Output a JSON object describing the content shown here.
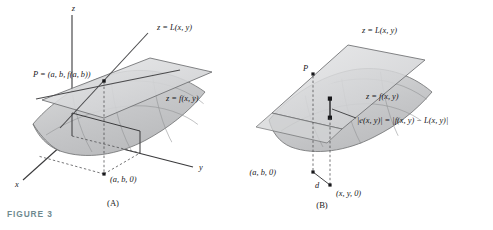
{
  "figure": {
    "caption": "FIGURE 3",
    "caption_color": "#6f8a90",
    "width": 493,
    "height": 230
  },
  "panels": [
    {
      "id": "A",
      "panel_label": "(A)",
      "axes": [
        {
          "name": "z-axis",
          "label": "z"
        },
        {
          "name": "y-axis",
          "label": "y"
        },
        {
          "name": "x-axis",
          "label": "x"
        }
      ],
      "labels": [
        {
          "name": "tangent-plane-label",
          "text": "z = L(x, y)"
        },
        {
          "name": "surface-label",
          "text": "z = f(x, y)"
        },
        {
          "name": "point-p-label",
          "text": "P = (a, b, f(a, b))"
        },
        {
          "name": "base-point-label",
          "text": "(a, b, 0)"
        }
      ]
    },
    {
      "id": "B",
      "panel_label": "(B)",
      "labels": [
        {
          "name": "tangent-plane-label",
          "text": "z = L(x, y)"
        },
        {
          "name": "surface-label",
          "text": "z = f(x, y)"
        },
        {
          "name": "point-p-label",
          "text": "P"
        },
        {
          "name": "error-label",
          "text": "|e(x, y)| = |f(x, y) − L(x, y)|"
        },
        {
          "name": "base-point-label",
          "text": "(a, b, 0)"
        },
        {
          "name": "distance-label",
          "text": "d"
        },
        {
          "name": "query-point-label",
          "text": "(x, y, 0)"
        }
      ]
    }
  ],
  "colors": {
    "plane_fill": "#d9dadb",
    "surface_fill": "#c9cacb",
    "surface_fill_light": "#dededf",
    "stroke": "#6d6e70",
    "axis": "#3a3a3c",
    "dashed": "#4a4a4c",
    "text": "#17171a"
  }
}
